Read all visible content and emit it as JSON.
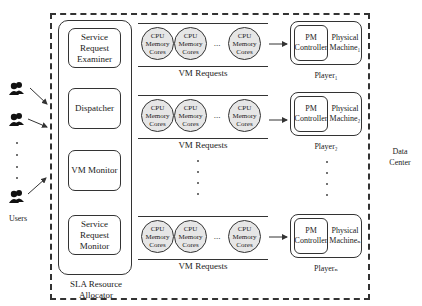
{
  "diagram": {
    "data_center_label": "Data Center",
    "users": {
      "label": "Users",
      "icon": "users-group-icon",
      "count_visible": 3
    },
    "sla_resource_allocator": {
      "label": "SLA Resource Allocator",
      "modules": [
        {
          "label": "Service Request Examiner"
        },
        {
          "label": "Dispatcher"
        },
        {
          "label": "VM Monitor"
        },
        {
          "label": "Service Request Monitor"
        }
      ]
    },
    "vm_queues": [
      {
        "label": "VM Requests",
        "vms": [
          {
            "label": "CPU Memory Cores"
          },
          {
            "label": "CPU Memory Cores"
          },
          {
            "label": "CPU Memory Cores"
          }
        ],
        "ellipsis": "..."
      },
      {
        "label": "VM Requests",
        "vms": [
          {
            "label": "CPU Memory Cores"
          },
          {
            "label": "CPU Memory Cores"
          },
          {
            "label": "CPU Memory Cores"
          }
        ],
        "ellipsis": "..."
      },
      {
        "label": "VM Requests",
        "vms": [
          {
            "label": "CPU Memory Cores"
          },
          {
            "label": "CPU Memory Cores"
          },
          {
            "label": "CPU Memory Cores"
          }
        ],
        "ellipsis": "..."
      }
    ],
    "players": [
      {
        "controller": "PM Controller",
        "machine": "Physical Machine₁",
        "label": "Player₁"
      },
      {
        "controller": "PM Controller",
        "machine": "Physical Machine₂",
        "label": "Player₂"
      },
      {
        "controller": "PM Controller",
        "machine": "Physical Machineₙ",
        "label": "Playerₙ"
      }
    ]
  }
}
